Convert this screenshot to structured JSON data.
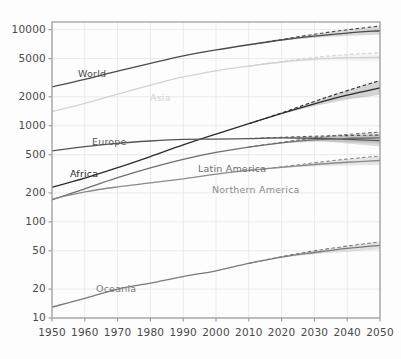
{
  "chart_data": {
    "type": "line",
    "title": "",
    "subtitle": "",
    "xlabel": "",
    "ylabel": "",
    "yscale": "log",
    "xlim": [
      1950,
      2050
    ],
    "ylim": [
      10,
      12000
    ],
    "grid": true,
    "legend_position": "inline-labels",
    "projection_start": 2015,
    "annotation": "Solid lines are median estimates; dashed lines are upper prediction bounds; shaded envelopes are prediction intervals after 2015.",
    "yticks": [
      10,
      20,
      50,
      100,
      200,
      500,
      1000,
      2000,
      5000,
      10000
    ],
    "ytick_labels": [
      "10",
      "20",
      "50",
      "100",
      "200",
      "500",
      "1000",
      "2000",
      "5000",
      "10000"
    ],
    "xticks": [
      1950,
      1960,
      1970,
      1980,
      1990,
      2000,
      2010,
      2020,
      2030,
      2040,
      2050
    ],
    "xtick_labels": [
      "1950",
      "1960",
      "1970",
      "1980",
      "1990",
      "2000",
      "2010",
      "2020",
      "2030",
      "2040",
      "2050"
    ],
    "x": [
      1950,
      1960,
      1970,
      1980,
      1990,
      2000,
      2010,
      2020,
      2030,
      2040,
      2050
    ],
    "series": [
      {
        "name": "World",
        "label": "World",
        "color": "#4a4a4a",
        "label_x": 78,
        "label_y": 68,
        "values": [
          2536,
          3035,
          3700,
          4458,
          5327,
          6145,
          6958,
          7795,
          8551,
          9198,
          9735
        ],
        "upper": [
          2536,
          3035,
          3700,
          4458,
          5327,
          6145,
          6958,
          7900,
          8950,
          9950,
          10900
        ],
        "lower": [
          2536,
          3035,
          3700,
          4458,
          5327,
          6145,
          6958,
          7700,
          8250,
          8600,
          8900
        ]
      },
      {
        "name": "Asia",
        "label": "Asia",
        "color": "#d2d2d2",
        "label_x": 150,
        "label_y": 92,
        "values": [
          1405,
          1706,
          2138,
          2642,
          3221,
          3730,
          4170,
          4601,
          4923,
          5101,
          5160
        ],
        "upper": [
          1405,
          1706,
          2138,
          2642,
          3221,
          3730,
          4170,
          4660,
          5130,
          5500,
          5750
        ],
        "lower": [
          1405,
          1706,
          2138,
          2642,
          3221,
          3730,
          4170,
          4545,
          4730,
          4740,
          4620
        ]
      },
      {
        "name": "Africa",
        "label": "Africa",
        "color": "#2b2b2b",
        "label_x": 70,
        "label_y": 168,
        "values": [
          229,
          285,
          366,
          478,
          632,
          818,
          1049,
          1341,
          1688,
          2077,
          2478
        ],
        "upper": [
          229,
          285,
          366,
          478,
          632,
          818,
          1049,
          1360,
          1790,
          2320,
          2950
        ],
        "lower": [
          229,
          285,
          366,
          478,
          632,
          818,
          1049,
          1325,
          1600,
          1870,
          2100
        ]
      },
      {
        "name": "Europe",
        "label": "Europe",
        "color": "#555555",
        "label_x": 92,
        "label_y": 136,
        "values": [
          549,
          605,
          657,
          694,
          721,
          726,
          736,
          747,
          741,
          722,
          700
        ],
        "upper": [
          549,
          605,
          657,
          694,
          721,
          726,
          736,
          757,
          778,
          790,
          800
        ],
        "lower": [
          549,
          605,
          657,
          694,
          721,
          726,
          736,
          737,
          705,
          655,
          610
        ]
      },
      {
        "name": "Latin America",
        "label": "Latin America",
        "color": "#6e6e6e",
        "label_x": 198,
        "label_y": 163,
        "values": [
          169,
          221,
          288,
          364,
          447,
          527,
          600,
          664,
          712,
          740,
          746
        ],
        "upper": [
          169,
          221,
          288,
          364,
          447,
          527,
          600,
          672,
          748,
          812,
          860
        ],
        "lower": [
          169,
          221,
          288,
          364,
          447,
          527,
          600,
          656,
          678,
          672,
          650
        ]
      },
      {
        "name": "Northern America",
        "label": "Northern America",
        "color": "#8a8a8a",
        "label_x": 212,
        "label_y": 184,
        "values": [
          172,
          205,
          231,
          254,
          280,
          313,
          343,
          369,
          395,
          417,
          435
        ],
        "upper": [
          172,
          205,
          231,
          254,
          280,
          313,
          343,
          374,
          412,
          450,
          485
        ],
        "lower": [
          172,
          205,
          231,
          254,
          280,
          313,
          343,
          364,
          379,
          386,
          390
        ]
      },
      {
        "name": "Oceania",
        "label": "Oceania",
        "color": "#7a7a7a",
        "label_x": 96,
        "label_y": 283,
        "values": [
          13,
          16,
          20,
          23,
          27,
          31,
          37,
          43,
          48,
          53,
          57
        ],
        "upper": [
          13,
          16,
          20,
          23,
          27,
          31,
          37,
          43.5,
          50,
          56,
          62
        ],
        "lower": [
          13,
          16,
          20,
          23,
          27,
          31,
          37,
          42.5,
          46,
          49,
          52
        ]
      }
    ]
  },
  "figure": {
    "plot_left": 52,
    "plot_right": 380,
    "plot_top": 22,
    "plot_bottom": 318,
    "axis_color": "#9a9a9a",
    "grid_color": "#e9eaec",
    "background": "#ffffff"
  }
}
